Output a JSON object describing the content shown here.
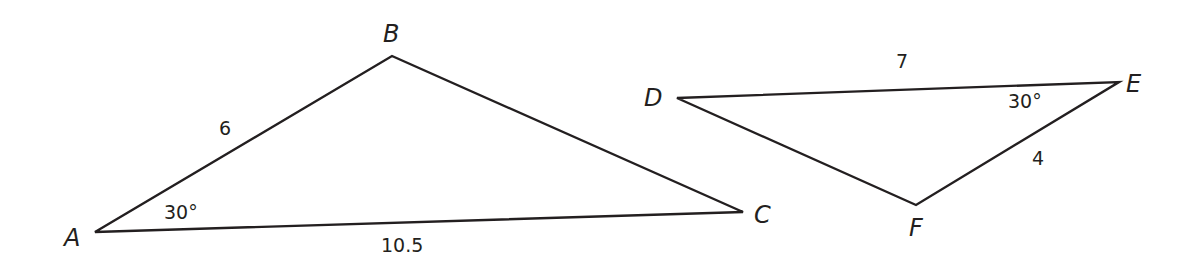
{
  "diagram": {
    "stroke_color": "#231f20",
    "background": "#ffffff",
    "triangles": [
      {
        "name": "ABC",
        "vertices": [
          {
            "label": "A",
            "x": 95,
            "y": 232,
            "lx": 64,
            "ly": 246
          },
          {
            "label": "B",
            "x": 392,
            "y": 56,
            "lx": 383,
            "ly": 42
          },
          {
            "label": "C",
            "x": 743,
            "y": 212,
            "lx": 754,
            "ly": 223
          }
        ],
        "sides": [
          {
            "between": "AB",
            "value": "6",
            "lx": 219,
            "ly": 135
          },
          {
            "between": "AC",
            "value": "10.5",
            "lx": 381,
            "ly": 252
          }
        ],
        "angles": [
          {
            "at": "A",
            "value": "30°",
            "lx": 164,
            "ly": 219
          }
        ]
      },
      {
        "name": "DEF",
        "vertices": [
          {
            "label": "D",
            "x": 677,
            "y": 98,
            "lx": 644,
            "ly": 106
          },
          {
            "label": "E",
            "x": 1119,
            "y": 82,
            "lx": 1126,
            "ly": 92
          },
          {
            "label": "F",
            "x": 916,
            "y": 205,
            "lx": 909,
            "ly": 236
          }
        ],
        "sides": [
          {
            "between": "DE",
            "value": "7",
            "lx": 896,
            "ly": 68
          },
          {
            "between": "EF",
            "value": "4",
            "lx": 1032,
            "ly": 165
          }
        ],
        "angles": [
          {
            "at": "E",
            "value": "30°",
            "lx": 1008,
            "ly": 108
          }
        ]
      }
    ]
  }
}
